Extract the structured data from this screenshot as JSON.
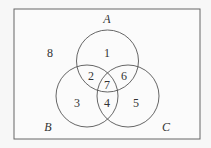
{
  "diagram": {
    "type": "venn",
    "sets": [
      {
        "name": "A",
        "label": "A"
      },
      {
        "name": "B",
        "label": "B"
      },
      {
        "name": "C",
        "label": "C"
      }
    ],
    "regions": {
      "r1": "1",
      "r2": "2",
      "r3": "3",
      "r4": "4",
      "r5": "5",
      "r6": "6",
      "r7": "7",
      "r8": "8"
    },
    "colors": {
      "background": "#f7f7f7",
      "stroke": "#555555"
    }
  }
}
